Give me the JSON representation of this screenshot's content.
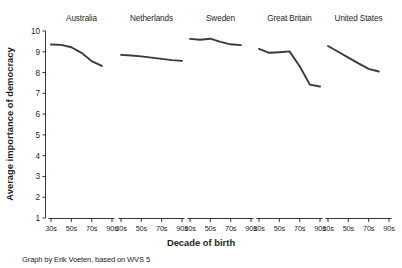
{
  "chart_data": {
    "type": "line",
    "title": "",
    "xlabel": "Decade of birth",
    "ylabel": "Average importance of democracy",
    "ylim": [
      1,
      10
    ],
    "yticks": [
      1,
      2,
      3,
      4,
      5,
      6,
      7,
      8,
      9,
      10
    ],
    "categories": [
      "30s",
      "50s",
      "70s",
      "90s"
    ],
    "x": [
      "30s",
      "40s",
      "50s",
      "60s",
      "70s",
      "80s",
      "90s"
    ],
    "grid": false,
    "legend": "none",
    "layout": "small-multiples",
    "panels": [
      {
        "name": "Australia",
        "x": [
          "30s",
          "40s",
          "50s",
          "60s",
          "70s",
          "80s"
        ],
        "values": [
          9.35,
          9.33,
          9.22,
          8.95,
          8.55,
          8.32
        ]
      },
      {
        "name": "Netherlands",
        "x": [
          "30s",
          "40s",
          "50s",
          "60s",
          "70s",
          "80s",
          "90s"
        ],
        "values": [
          8.85,
          8.82,
          8.78,
          8.72,
          8.66,
          8.6,
          8.56
        ]
      },
      {
        "name": "Sweden",
        "x": [
          "30s",
          "40s",
          "50s",
          "60s",
          "70s",
          "80s"
        ],
        "values": [
          9.62,
          9.58,
          9.63,
          9.48,
          9.36,
          9.32
        ]
      },
      {
        "name": "Great Britain",
        "x": [
          "30s",
          "40s",
          "50s",
          "60s",
          "70s",
          "80s",
          "90s"
        ],
        "values": [
          9.14,
          8.95,
          8.98,
          9.02,
          8.3,
          7.42,
          7.33
        ]
      },
      {
        "name": "United States",
        "x": [
          "30s",
          "40s",
          "50s",
          "60s",
          "70s",
          "80s"
        ],
        "values": [
          9.28,
          9.0,
          8.72,
          8.44,
          8.18,
          8.05
        ]
      }
    ]
  },
  "caption": {
    "text": "Graph by Erik Voeten, based on WVS 5"
  },
  "colors": {
    "line": "#3a3a3c",
    "axis": "#231f20",
    "background": "#ffffff"
  }
}
